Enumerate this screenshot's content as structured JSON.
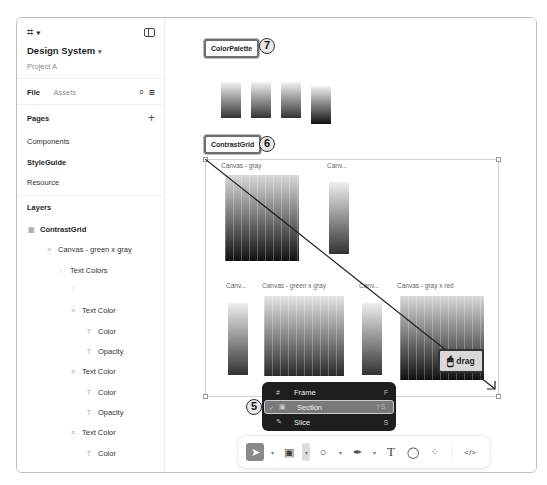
{
  "sidebar": {
    "project_title": "Design System",
    "project_subtitle": "Project A",
    "tabs": [
      "File",
      "Assets"
    ],
    "pages_label": "Pages",
    "pages": [
      "Components",
      "StyleGuide",
      "Resource"
    ],
    "layers_label": "Layers",
    "layers": [
      {
        "label": "ContrastGrid",
        "icon": "section-icon",
        "indent": 0
      },
      {
        "label": "Canvas - green x gray",
        "icon": "frame-icon",
        "indent": 1
      },
      {
        "label": "Text Colors",
        "icon": "autolayout-icon",
        "indent": 2
      },
      {
        "label": "",
        "icon": "component-icon",
        "indent": 3
      },
      {
        "label": "Text Color",
        "icon": "frame-icon",
        "indent": 3
      },
      {
        "label": "Color",
        "icon": "text-icon",
        "indent": 4
      },
      {
        "label": "Opacity",
        "icon": "text-icon",
        "indent": 4
      },
      {
        "label": "Text Color",
        "icon": "frame-icon",
        "indent": 3
      },
      {
        "label": "Color",
        "icon": "text-icon",
        "indent": 4
      },
      {
        "label": "Opacity",
        "icon": "text-icon",
        "indent": 4
      },
      {
        "label": "Text Color",
        "icon": "frame-icon",
        "indent": 3
      },
      {
        "label": "Color",
        "icon": "text-icon",
        "indent": 4
      }
    ]
  },
  "canvas": {
    "frames": [
      {
        "label": "ColorPalette",
        "badge": "7"
      },
      {
        "label": "ContrastGrid",
        "badge": "6"
      }
    ],
    "canvas_labels": [
      "Canvas - gray",
      "Canv...",
      "Canv...",
      "Canvas - green x gray",
      "Canv...",
      "Canvas - gray x red"
    ],
    "drag_tip": "drag"
  },
  "context_menu": {
    "badge": "5",
    "items": [
      {
        "label": "Frame",
        "shortcut": "F",
        "icon": "#",
        "checked": false
      },
      {
        "label": "Section",
        "shortcut": "⇧S",
        "icon": "▣",
        "checked": true
      },
      {
        "label": "Slice",
        "shortcut": "S",
        "icon": "✎",
        "checked": false
      }
    ]
  },
  "toolbar": {
    "tools": [
      "move",
      "frame",
      "shape",
      "pen",
      "text",
      "comment",
      "actions",
      "dev-mode"
    ]
  }
}
